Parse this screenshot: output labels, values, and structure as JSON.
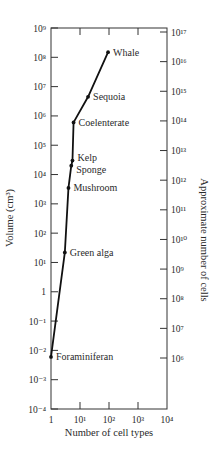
{
  "chart_data": {
    "type": "line",
    "title": "",
    "xlabel": "Number of cell types",
    "ylabel": "Volume (cm³)",
    "y2label": "Approximate number of cells",
    "xscale": "log",
    "yscale": "log",
    "xlim": [
      1,
      10000
    ],
    "ylim": [
      0.0001,
      1000000000
    ],
    "y2lim": [
      100000.0,
      1e+18
    ],
    "grid": false,
    "legend": "none",
    "x_ticks": [
      {
        "value": 1,
        "label": "1"
      },
      {
        "value": 10,
        "label": "10¹"
      },
      {
        "value": 100,
        "label": "10²"
      },
      {
        "value": 1000,
        "label": "10³"
      },
      {
        "value": 10000,
        "label": "10⁴"
      }
    ],
    "y_ticks": [
      {
        "value": 1000000000.0,
        "label": "10⁹"
      },
      {
        "value": 100000000.0,
        "label": "10⁸"
      },
      {
        "value": 10000000.0,
        "label": "10⁷"
      },
      {
        "value": 1000000.0,
        "label": "10⁶"
      },
      {
        "value": 100000.0,
        "label": "10⁵"
      },
      {
        "value": 10000.0,
        "label": "10⁴"
      },
      {
        "value": 1000.0,
        "label": "10³"
      },
      {
        "value": 100.0,
        "label": "10²"
      },
      {
        "value": 10.0,
        "label": "10¹"
      },
      {
        "value": 1,
        "label": "1"
      },
      {
        "value": 0.1,
        "label": "10⁻¹"
      },
      {
        "value": 0.01,
        "label": "10⁻²"
      },
      {
        "value": 0.001,
        "label": "10⁻³"
      },
      {
        "value": 0.0001,
        "label": "10⁻⁴"
      }
    ],
    "y2_ticks": [
      {
        "value": 1e+17,
        "label": "10¹⁷"
      },
      {
        "value": 1e+16,
        "label": "10¹⁶"
      },
      {
        "value": 1000000000000000.0,
        "label": "10¹⁵"
      },
      {
        "value": 100000000000000.0,
        "label": "10¹⁴"
      },
      {
        "value": 10000000000000.0,
        "label": "10¹³"
      },
      {
        "value": 1000000000000.0,
        "label": "10¹²"
      },
      {
        "value": 100000000000.0,
        "label": "10¹¹"
      },
      {
        "value": 10000000000.0,
        "label": "10¹⁰"
      },
      {
        "value": 1000000000.0,
        "label": "10⁹"
      },
      {
        "value": 100000000.0,
        "label": "10⁸"
      },
      {
        "value": 10000000.0,
        "label": "10⁷"
      },
      {
        "value": 1000000.0,
        "label": "10⁶"
      }
    ],
    "series": [
      {
        "name": "Organisms",
        "points": [
          {
            "label": "Foraminiferan",
            "x": 1,
            "y": 0.006
          },
          {
            "label": "Green alga",
            "x": 3,
            "y": 22
          },
          {
            "label": "Mushroom",
            "x": 4,
            "y": 3500
          },
          {
            "label": "Sponge",
            "x": 5,
            "y": 20000
          },
          {
            "label": "Kelp",
            "x": 5.5,
            "y": 30000
          },
          {
            "label": "Coelenterate",
            "x": 6,
            "y": 600000
          },
          {
            "label": "Sequoia",
            "x": 19,
            "y": 4500000
          },
          {
            "label": "Whale",
            "x": 93,
            "y": 150000000
          }
        ]
      }
    ]
  }
}
